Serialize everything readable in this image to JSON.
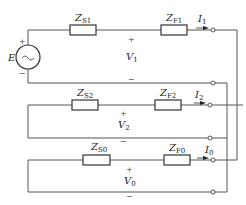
{
  "diagram": {
    "source": {
      "label": "E",
      "plus_sign": "+",
      "minus_sign": "−",
      "symbol": "~"
    },
    "networks": [
      {
        "name": "positive-sequence",
        "zs": {
          "main": "Z",
          "sub": "S1"
        },
        "zf": {
          "main": "Z",
          "sub": "F1"
        },
        "current": {
          "main": "I",
          "sub": "1"
        },
        "voltage": {
          "main": "V",
          "sub": "1"
        },
        "plus_sign": "+",
        "minus_sign": "−"
      },
      {
        "name": "negative-sequence",
        "zs": {
          "main": "Z",
          "sub": "S2"
        },
        "zf": {
          "main": "Z",
          "sub": "F2"
        },
        "current": {
          "main": "I",
          "sub": "2"
        },
        "voltage": {
          "main": "V",
          "sub": "2"
        },
        "plus_sign": "+",
        "minus_sign": "−"
      },
      {
        "name": "zero-sequence",
        "zs": {
          "main": "Z",
          "sub": "S0"
        },
        "zf": {
          "main": "Z",
          "sub": "F0"
        },
        "current": {
          "main": "I",
          "sub": "0"
        },
        "voltage": {
          "main": "V",
          "sub": "0"
        },
        "plus_sign": "+",
        "minus_sign": "−"
      }
    ],
    "line_color": "#555555",
    "component_color": "#333333"
  }
}
